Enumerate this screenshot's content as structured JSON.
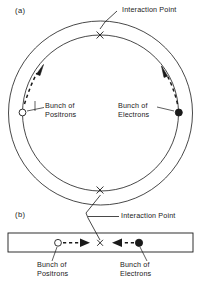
{
  "figure": {
    "stroke_color": "#1a1a1a",
    "background_color": "#ffffff",
    "positron_marker": "open-circle",
    "electron_marker": "filled-circle",
    "interaction_marker": "x-cross"
  },
  "panel_a": {
    "tag": "(a)",
    "type": "storage-ring",
    "interaction_point_label": "Interaction Point",
    "positron_label_line1": "Bunch of",
    "positron_label_line2": "Positrons",
    "electron_label_line1": "Bunch of",
    "electron_label_line2": "Electrons",
    "ring": {
      "center_x": 100.5,
      "center_y": 113,
      "outer_radius": 92,
      "inner_radius": 78
    },
    "markers": {
      "interaction_point_top": {
        "x": 100,
        "y": 35
      },
      "interaction_point_bottom": {
        "x": 100,
        "y": 190
      },
      "positron_bunch": {
        "x": 22,
        "y": 112
      },
      "electron_bunch": {
        "x": 179,
        "y": 112
      }
    },
    "arrows": {
      "positron_direction": "counterclockwise-up-right",
      "electron_direction": "counterclockwise-up-left"
    }
  },
  "panel_b": {
    "tag": "(b)",
    "type": "linear-collider",
    "interaction_point_label": "Interaction Point",
    "positron_label_line1": "Bunch of",
    "positron_label_line2": "Positrons",
    "electron_label_line1": "Bunch of",
    "electron_label_line2": "Electrons",
    "beamline": {
      "x": 8,
      "y": 233,
      "width": 185,
      "height": 19
    },
    "markers": {
      "interaction_point": {
        "x": 100,
        "y": 243
      },
      "positron_bunch": {
        "x": 58,
        "y": 243
      },
      "electron_bunch": {
        "x": 139,
        "y": 243
      }
    },
    "arrows": {
      "positron_direction": "right",
      "electron_direction": "left"
    }
  }
}
